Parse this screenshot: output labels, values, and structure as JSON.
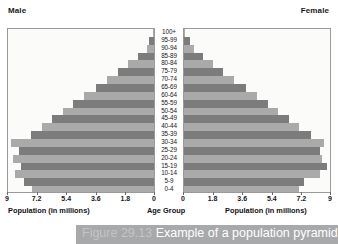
{
  "header": {
    "male_label": "Male",
    "female_label": "Female"
  },
  "axis_titles": {
    "left": "Population (in millions)",
    "center": "Age Group",
    "right": "Population (in millions)"
  },
  "caption": {
    "figure_number": "Figure 29.13",
    "text": "Example of a population pyramid"
  },
  "colors": {
    "bar_dark": "#7c7c7c",
    "bar_light": "#aaaaaa",
    "panel_border": "#9a9a9a",
    "panel_bg": "#fbfbf9",
    "caption_band": "#a7a9ab",
    "caption_text": "#ffffff",
    "figure_number_text": "#c3c5c7",
    "text": "#17171a"
  },
  "chart_data": {
    "type": "bar",
    "title": "Example of a population pyramid",
    "subtype": "population-pyramid",
    "orientation": "horizontal",
    "xlabel": "Population (in millions)",
    "ylabel": "Age Group",
    "xlim": [
      0,
      9
    ],
    "grid": false,
    "legend_position": "top",
    "tick_values_left": [
      "9",
      "7.2",
      "5.4",
      "3.6",
      "1.8",
      "0"
    ],
    "tick_values_right": [
      "0",
      "1.8",
      "3.6",
      "5.4",
      "7.2",
      "9"
    ],
    "tick_numbers": [
      0,
      1.8,
      3.6,
      5.4,
      7.2,
      9
    ],
    "categories": [
      "100+",
      "95-99",
      "90-94",
      "85-89",
      "80-84",
      "75-79",
      "70-74",
      "65-69",
      "60-64",
      "55-59",
      "50-54",
      "45-49",
      "40-44",
      "35-39",
      "30-34",
      "25-29",
      "20-24",
      "15-19",
      "10-14",
      "5-9",
      "0-4"
    ],
    "series": [
      {
        "name": "Male",
        "side": "left",
        "values": [
          0.05,
          0.3,
          0.45,
          1.0,
          1.6,
          2.2,
          2.9,
          3.6,
          4.3,
          5.0,
          5.6,
          6.3,
          6.9,
          7.6,
          8.8,
          8.3,
          8.7,
          8.2,
          8.6,
          8.0,
          7.5
        ]
      },
      {
        "name": "Female",
        "side": "right",
        "values": [
          0.08,
          0.35,
          0.6,
          1.2,
          1.8,
          2.4,
          3.1,
          3.8,
          4.5,
          5.2,
          5.8,
          6.5,
          7.1,
          7.8,
          8.6,
          8.4,
          8.5,
          8.8,
          8.4,
          7.4,
          7.1
        ]
      }
    ]
  }
}
